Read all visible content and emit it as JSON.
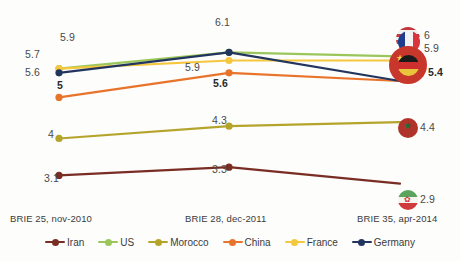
{
  "chart_data": {
    "type": "line",
    "title": "",
    "xlabel": "",
    "ylabel": "",
    "categories": [
      "BRIE 25, nov-2010",
      "BRIE 28, dec-2011",
      "BRIE 35, apr-2014"
    ],
    "legend_position": "bottom",
    "grid": false,
    "ylim": [
      2.5,
      6.4
    ],
    "series": [
      {
        "name": "Iran",
        "color": "#7a2d24",
        "values": [
          3.1,
          3.3,
          2.9
        ]
      },
      {
        "name": "US",
        "color": "#9ac65b",
        "values": [
          5.7,
          6.1,
          6.0
        ]
      },
      {
        "name": "Morocco",
        "color": "#b5a42c",
        "values": [
          4.0,
          4.3,
          4.4
        ]
      },
      {
        "name": "China",
        "color": "#e8742c",
        "values": [
          5.0,
          5.6,
          5.4
        ]
      },
      {
        "name": "France",
        "color": "#f5c73f",
        "values": [
          5.7,
          5.9,
          5.9
        ]
      },
      {
        "name": "Germany",
        "color": "#22355e",
        "values": [
          5.6,
          6.1,
          5.4
        ]
      }
    ],
    "point_labels": [
      {
        "text": "5.9",
        "x": 60,
        "y": 31,
        "bold": false
      },
      {
        "text": "5.7",
        "x": 25,
        "y": 48,
        "bold": false
      },
      {
        "text": "5.6",
        "x": 25,
        "y": 66,
        "bold": false
      },
      {
        "text": "5",
        "x": 57,
        "y": 79,
        "bold": true
      },
      {
        "text": "6.1",
        "x": 215,
        "y": 16,
        "bold": false
      },
      {
        "text": "5.9",
        "x": 185,
        "y": 61,
        "bold": false
      },
      {
        "text": "5.6",
        "x": 213,
        "y": 77,
        "bold": true
      },
      {
        "text": "6",
        "x": 424,
        "y": 29,
        "bold": false
      },
      {
        "text": "5.9",
        "x": 424,
        "y": 42,
        "bold": false
      },
      {
        "text": "5.4",
        "x": 428,
        "y": 66,
        "bold": true
      },
      {
        "text": "4",
        "x": 48,
        "y": 128,
        "bold": false
      },
      {
        "text": "4.3",
        "x": 212,
        "y": 114,
        "bold": false
      },
      {
        "text": "4.4",
        "x": 420,
        "y": 121,
        "bold": false
      },
      {
        "text": "3.1",
        "x": 44,
        "y": 172,
        "bold": false
      },
      {
        "text": "3.3",
        "x": 212,
        "y": 163,
        "bold": false
      },
      {
        "text": "2.9",
        "x": 420,
        "y": 193,
        "bold": false
      }
    ],
    "axis_labels": [
      {
        "text": "BRIE 25, nov-2010",
        "x": 10,
        "y": 213
      },
      {
        "text": "BRIE 28, dec-2011",
        "x": 185,
        "y": 213
      },
      {
        "text": "BRIE 35, apr-2014",
        "x": 357,
        "y": 213
      }
    ],
    "flag_markers": [
      {
        "country": "US",
        "icon": "flag-us-icon",
        "x": 396,
        "y": 27,
        "size": 24
      },
      {
        "country": "France",
        "icon": "flag-fr-icon",
        "x": 398,
        "y": 31,
        "size": 22
      },
      {
        "country": "China",
        "icon": "flag-cn-icon",
        "x": 389,
        "y": 46,
        "size": 38
      },
      {
        "country": "Germany",
        "icon": "flag-de-icon",
        "x": 398,
        "y": 55,
        "size": 21
      },
      {
        "country": "Morocco",
        "icon": "flag-ma-icon",
        "x": 398,
        "y": 118,
        "size": 20
      },
      {
        "country": "Iran",
        "icon": "flag-ir-icon",
        "x": 398,
        "y": 190,
        "size": 20
      }
    ],
    "caption": ""
  },
  "legend": {
    "items": [
      {
        "label": "Iran",
        "color": "#7a2d24"
      },
      {
        "label": "US",
        "color": "#9ac65b"
      },
      {
        "label": "Morocco",
        "color": "#b5a42c"
      },
      {
        "label": "China",
        "color": "#e8742c"
      },
      {
        "label": "France",
        "color": "#f5c73f"
      },
      {
        "label": "Germany",
        "color": "#22355e"
      }
    ]
  }
}
